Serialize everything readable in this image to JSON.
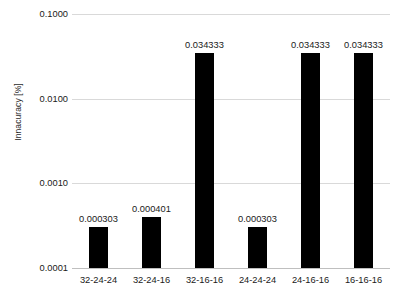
{
  "chart_data": {
    "type": "bar",
    "title": "",
    "subtitle": "",
    "xlabel": "",
    "ylabel": "Innacuracy [%]",
    "categories": [
      "32-24-24",
      "32-24-16",
      "32-16-16",
      "24-24-24",
      "24-16-16",
      "16-16-16"
    ],
    "values": [
      0.000303,
      0.000401,
      0.034333,
      0.000303,
      0.034333,
      0.034333
    ],
    "data_labels": [
      "0.000303",
      "0.000401",
      "0.034333",
      "0.000303",
      "0.034333",
      "0.034333"
    ],
    "yscale": "log",
    "ylim": [
      0.0001,
      0.1
    ],
    "ytick_values": [
      0.1,
      0.01,
      0.001,
      0.0001
    ],
    "ytick_labels": [
      "0.1000",
      "0.0100",
      "0.0010",
      "0.0001"
    ],
    "grid": true,
    "legend": null,
    "legend_position": "none",
    "bar_color": "#000000",
    "gridline_color": "#d9d9d9",
    "axis_color": "#bfbfbf",
    "text_color": "#1a1a1a"
  }
}
